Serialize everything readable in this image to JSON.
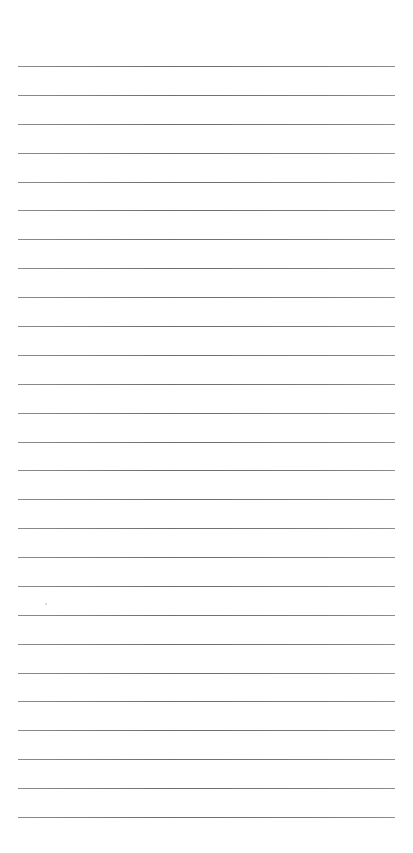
{
  "page": {
    "type": "lined-paper",
    "background_color": "#ffffff",
    "rule_color": "#777777",
    "rule_count": 27,
    "header_text": ""
  }
}
